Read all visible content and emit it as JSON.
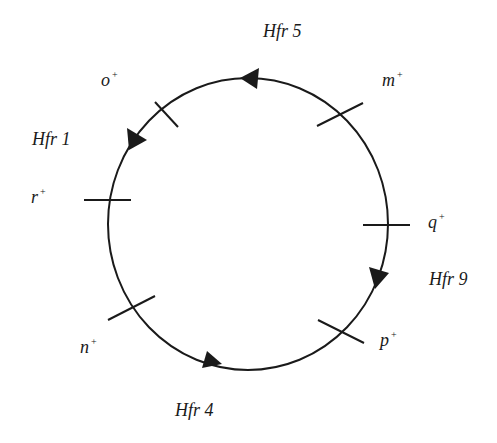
{
  "diagram": {
    "type": "circular-chromosome-map",
    "stroke_color": "#1a1a1a",
    "genes": [
      {
        "id": "o",
        "name": "o",
        "superscript": "+"
      },
      {
        "id": "m",
        "name": "m",
        "superscript": "+"
      },
      {
        "id": "r",
        "name": "r",
        "superscript": "+"
      },
      {
        "id": "q",
        "name": "q",
        "superscript": "+"
      },
      {
        "id": "p",
        "name": "p",
        "superscript": "+"
      },
      {
        "id": "n",
        "name": "n",
        "superscript": "+"
      }
    ],
    "hfr_strains": [
      {
        "id": "hfr5",
        "label": "Hfr 5",
        "direction": "counterclockwise"
      },
      {
        "id": "hfr1",
        "label": "Hfr 1",
        "direction": "counterclockwise"
      },
      {
        "id": "hfr9",
        "label": "Hfr 9",
        "direction": "clockwise"
      },
      {
        "id": "hfr4",
        "label": "Hfr 4",
        "direction": "counterclockwise"
      }
    ]
  }
}
